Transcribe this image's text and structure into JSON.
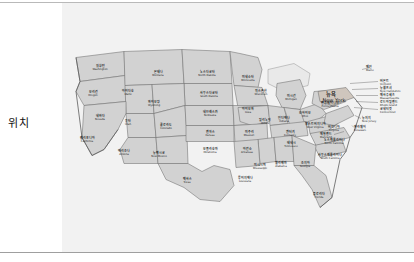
{
  "form": {
    "field_label": "위치"
  },
  "map": {
    "title": "위치",
    "region": "United States",
    "highlighted_state": {
      "ko": "뉴욕",
      "en": "New York"
    },
    "colors": {
      "panel_background": "#f2f2f2",
      "state_fill": "#d2d2d2",
      "state_border": "#6e6e6e",
      "highlight_fill": "#cfc6bd",
      "lake_fill": "#e9e9e9",
      "label_text": "#1a1a1a",
      "rule": "#b9b9b9"
    },
    "states": [
      {
        "ko": "워싱턴",
        "en": "Washington",
        "x": 38,
        "y": 27
      },
      {
        "ko": "몬태나",
        "en": "Montana",
        "x": 96,
        "y": 33
      },
      {
        "ko": "노스다코타",
        "en": "North Dakota",
        "x": 145,
        "y": 33
      },
      {
        "ko": "미네소타",
        "en": "Minnesota",
        "x": 186,
        "y": 38
      },
      {
        "ko": "오리건",
        "en": "Oregon",
        "x": 31,
        "y": 53
      },
      {
        "ko": "아이다호",
        "en": "Idaho",
        "x": 66,
        "y": 52
      },
      {
        "ko": "사우스다코타",
        "en": "South Dakota",
        "x": 147,
        "y": 54
      },
      {
        "ko": "위스콘신",
        "en": "Wisconsin",
        "x": 199,
        "y": 52
      },
      {
        "ko": "미시간",
        "en": "Michigan",
        "x": 229,
        "y": 57
      },
      {
        "ko": "와이오밍",
        "en": "Wyoming",
        "x": 92,
        "y": 63
      },
      {
        "ko": "네브래스카",
        "en": "Nebraska",
        "x": 148,
        "y": 73
      },
      {
        "ko": "아이오와",
        "en": "Iowa",
        "x": 186,
        "y": 70
      },
      {
        "ko": "네바다",
        "en": "Nevada",
        "x": 38,
        "y": 77
      },
      {
        "ko": "유타",
        "en": "Utah",
        "x": 66,
        "y": 82
      },
      {
        "ko": "콜로라도",
        "en": "Colorado",
        "x": 104,
        "y": 86
      },
      {
        "ko": "일리노이",
        "en": "Illinois",
        "x": 203,
        "y": 81
      },
      {
        "ko": "인디애나",
        "en": "Indiana",
        "x": 222,
        "y": 79
      },
      {
        "ko": "오하이오",
        "en": "Ohio",
        "x": 243,
        "y": 74
      },
      {
        "ko": "펜실베이니아",
        "en": "Pennsylvania",
        "x": 268,
        "y": 64
      },
      {
        "ko": "캘리포니아",
        "en": "California",
        "x": 25,
        "y": 99
      },
      {
        "ko": "캔자스",
        "en": "Kansas",
        "x": 148,
        "y": 93
      },
      {
        "ko": "미주리",
        "en": "Missouri",
        "x": 187,
        "y": 93
      },
      {
        "ko": "켄터키",
        "en": "Kentucky",
        "x": 228,
        "y": 93
      },
      {
        "ko": "웨스트버지니아",
        "en": "West Virginia",
        "x": 253,
        "y": 85
      },
      {
        "ko": "버지니아",
        "en": "Virginia",
        "x": 272,
        "y": 88
      },
      {
        "ko": "애리조나",
        "en": "Arizona",
        "x": 62,
        "y": 112
      },
      {
        "ko": "뉴멕시코",
        "en": "New Mexico",
        "x": 97,
        "y": 114
      },
      {
        "ko": "오클라호마",
        "en": "Oklahoma",
        "x": 148,
        "y": 110
      },
      {
        "ko": "아칸소",
        "en": "Arkansas",
        "x": 185,
        "y": 110
      },
      {
        "ko": "테네시",
        "en": "Tennessee",
        "x": 229,
        "y": 104
      },
      {
        "ko": "노스캐롤라이나",
        "en": "North Carolina",
        "x": 272,
        "y": 101
      },
      {
        "ko": "사우스캐롤라이나",
        "en": "South Carolina",
        "x": 268,
        "y": 116
      },
      {
        "ko": "미시시피",
        "en": "Mississippi",
        "x": 198,
        "y": 126
      },
      {
        "ko": "앨라배마",
        "en": "Alabama",
        "x": 219,
        "y": 124
      },
      {
        "ko": "조지아",
        "en": "Georgia",
        "x": 243,
        "y": 124
      },
      {
        "ko": "텍사스",
        "en": "Texas",
        "x": 125,
        "y": 140
      },
      {
        "ko": "루이지애나",
        "en": "Louisiana",
        "x": 183,
        "y": 139
      },
      {
        "ko": "플로리다",
        "en": "Florida",
        "x": 257,
        "y": 155
      }
    ],
    "callout_states": [
      {
        "ko": "메인",
        "en": "Maine",
        "x": 304,
        "y": 28
      },
      {
        "ko": "버몬트",
        "en": "Vermont",
        "x": 318,
        "y": 42,
        "side": "right"
      },
      {
        "ko": "뉴햄프셔",
        "en": "New Hampshire",
        "x": 318,
        "y": 49,
        "side": "right"
      },
      {
        "ko": "매사추세츠",
        "en": "Massachusetts",
        "x": 318,
        "y": 56,
        "side": "right"
      },
      {
        "ko": "로드아일랜드",
        "en": "Rhode Island",
        "x": 318,
        "y": 63,
        "side": "right"
      },
      {
        "ko": "코네티컷",
        "en": "Connecticut",
        "x": 318,
        "y": 70,
        "side": "right"
      },
      {
        "ko": "뉴저지",
        "en": "New Jersey",
        "x": 300,
        "y": 79,
        "side": "right"
      },
      {
        "ko": "델라웨어",
        "en": "Delaware",
        "x": 292,
        "y": 88,
        "side": "right"
      },
      {
        "ko": "메릴랜드",
        "en": "Maryland",
        "x": 270,
        "y": 95,
        "side": "left"
      }
    ]
  }
}
